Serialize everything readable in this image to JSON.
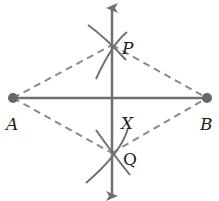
{
  "diagram": {
    "labels": {
      "A": "A",
      "B": "B",
      "P": "P",
      "Q": "Q",
      "X": "X"
    },
    "points": {
      "A": [
        13,
        98
      ],
      "B": [
        207,
        98
      ],
      "P": [
        112,
        45
      ],
      "Q": [
        112,
        153
      ],
      "X": [
        112,
        98
      ]
    },
    "colors": {
      "line": "#707070",
      "dashed": "#8a8a8a",
      "point": "#666666",
      "text": "#222222"
    }
  }
}
